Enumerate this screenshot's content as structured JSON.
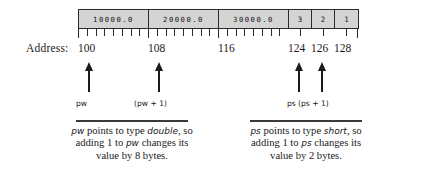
{
  "diagram": {
    "memory": {
      "cells": [
        {
          "label": "10000.0",
          "kind": "double",
          "width": 70,
          "ticks": 8
        },
        {
          "label": "20000.0",
          "kind": "double",
          "width": 70,
          "ticks": 8
        },
        {
          "label": "30000.0",
          "kind": "double",
          "width": 70,
          "ticks": 8
        },
        {
          "label": "3",
          "kind": "short",
          "width": 23,
          "ticks": 1
        },
        {
          "label": "2",
          "kind": "short",
          "width": 23,
          "ticks": 1
        },
        {
          "label": "1",
          "kind": "short",
          "width": 23,
          "ticks": 1
        }
      ]
    },
    "address_row": {
      "caption": "Address:",
      "labels": [
        {
          "text": "100",
          "x": 78
        },
        {
          "text": "108",
          "x": 148
        },
        {
          "text": "116",
          "x": 218
        },
        {
          "text": "124",
          "x": 288
        },
        {
          "text": "126",
          "x": 311
        },
        {
          "text": "128",
          "x": 334
        }
      ]
    },
    "pointers": [
      {
        "name": "pw",
        "label": "pw",
        "arrow_x": 83,
        "label_x": 76,
        "arrow_height": 30
      },
      {
        "name": "pw-plus-1",
        "label": "(pw + 1)",
        "arrow_x": 153,
        "label_x": 134,
        "arrow_height": 30
      },
      {
        "name": "ps",
        "label": "ps",
        "arrow_x": 293,
        "label_x": 287,
        "arrow_height": 30
      },
      {
        "name": "ps-plus-1",
        "label": "(ps + 1)",
        "arrow_x": 316,
        "label_x": 298,
        "arrow_height": 30
      }
    ],
    "captions": [
      {
        "name": "pw-caption",
        "line1_pre": "",
        "line1_var": "pw",
        "line1_mid": " points to type ",
        "line1_type": "double",
        "line1_post": ", so",
        "line2_pre": "adding 1 to ",
        "line2_var": "pw",
        "line2_post": " changes its",
        "line3": "value by 8 bytes."
      },
      {
        "name": "ps-caption",
        "line1_pre": "",
        "line1_var": "ps",
        "line1_mid": " points to type ",
        "line1_type": "short",
        "line1_post": ", so",
        "line2_pre": "adding 1 to ",
        "line2_var": "ps",
        "line2_post": " changes its",
        "line3": "value by 2 bytes."
      }
    ],
    "colors": {
      "cell_fill": "#d4d4d4",
      "stroke": "#2b2b2b",
      "text": "#1a1a1a",
      "background": "#ffffff"
    }
  }
}
